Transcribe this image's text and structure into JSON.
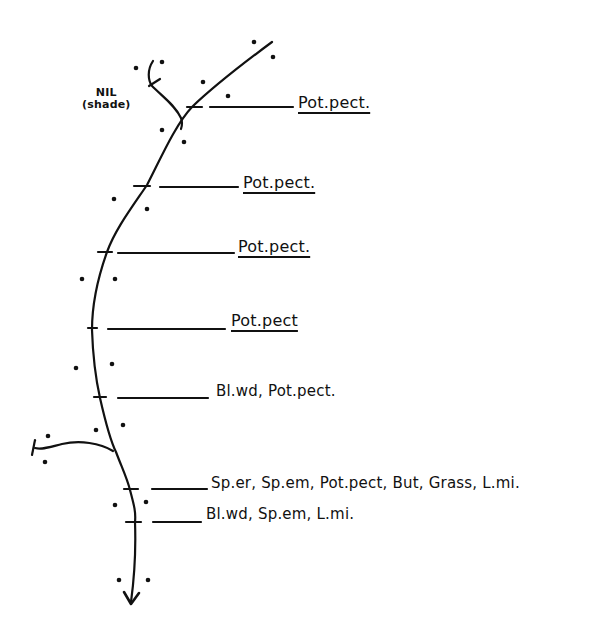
{
  "diagram": {
    "type": "hand-drawn stream survey sketch",
    "stroke_color": "#111111",
    "background": "#ffffff",
    "tributary_note": {
      "line1": "NIL",
      "line2": "(shade)"
    },
    "transects": [
      {
        "label": "Pot.pect.",
        "underlined": true
      },
      {
        "label": "Pot.pect.",
        "underlined": true
      },
      {
        "label": "Pot.pect.",
        "underlined": true
      },
      {
        "label": "Pot.pect",
        "underlined": true
      },
      {
        "label": "Bl.wd, Pot.pect.",
        "underlined": false
      },
      {
        "label": "Sp.er, Sp.em, Pot.pect, But, Grass, L.mi.",
        "underlined": false
      },
      {
        "label": "Bl.wd, Sp.em, L.mi.",
        "underlined": false
      }
    ],
    "flow_direction": "downstream arrow at bottom"
  }
}
